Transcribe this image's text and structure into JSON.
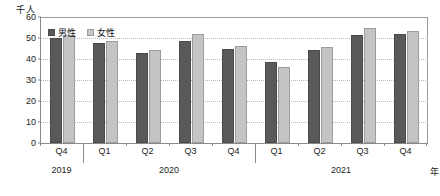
{
  "chart_data": {
    "type": "bar",
    "title": "",
    "subtitle": "",
    "ylabel": "千人",
    "xlabel": "年",
    "ylim": [
      0,
      60
    ],
    "yticks": [
      0,
      10,
      20,
      30,
      40,
      50,
      60
    ],
    "ytick_labels": [
      "0",
      "10",
      "20",
      "30",
      "40",
      "50",
      "60"
    ],
    "grid": true,
    "legend_position": "top-left",
    "categories": [
      "Q4",
      "Q1",
      "Q2",
      "Q3",
      "Q4",
      "Q1",
      "Q2",
      "Q3",
      "Q4"
    ],
    "group_labels": [
      {
        "label": "2019",
        "span": [
          0,
          0
        ]
      },
      {
        "label": "2020",
        "span": [
          1,
          4
        ]
      },
      {
        "label": "2021",
        "span": [
          5,
          8
        ]
      }
    ],
    "series": [
      {
        "name": "男性",
        "color": "#595959",
        "values": [
          50.0,
          47.4,
          43.1,
          48.4,
          44.7,
          38.4,
          44.2,
          51.4,
          51.9
        ]
      },
      {
        "name": "女性",
        "color": "#c4c4c4",
        "values": [
          51.4,
          48.4,
          44.2,
          51.9,
          46.0,
          36.4,
          45.5,
          55.0,
          53.4
        ]
      }
    ]
  }
}
